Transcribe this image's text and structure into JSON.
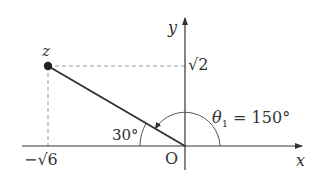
{
  "diagram": {
    "type": "complex-plane",
    "colors": {
      "stroke": "#333333",
      "dashed": "#999999",
      "background": "#ffffff"
    },
    "axes": {
      "x_label": "x",
      "y_label": "y",
      "origin_label": "O"
    },
    "point": {
      "label": "z",
      "real_label_sign": "−",
      "real_label_radicand": "6",
      "imag_label_radicand": "2"
    },
    "angles": {
      "inner": {
        "label": "30°",
        "value_deg": 30
      },
      "argument": {
        "symbol": "θ",
        "subscript": "1",
        "eq": " = ",
        "value": "150°",
        "value_deg": 150
      }
    }
  }
}
